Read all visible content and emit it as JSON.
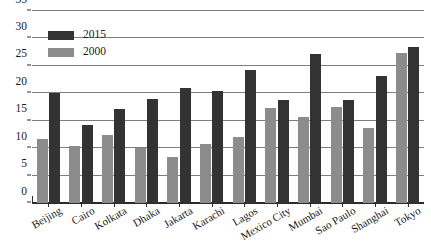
{
  "chart_data": {
    "type": "bar",
    "title": "",
    "subtitle": "",
    "xlabel": "",
    "ylabel": "",
    "ylim": [
      0,
      35
    ],
    "ytick_step": 5,
    "yticks": [
      0,
      5,
      10,
      15,
      20,
      25,
      30,
      35
    ],
    "ytick_labels": [
      "0",
      "5",
      "10",
      "15",
      "20",
      "25",
      "30",
      "35"
    ],
    "grid": true,
    "grid_axis": "y",
    "legend_position": "top-left",
    "categories": [
      "Beijing",
      "Cairo",
      "Kolkata",
      "Dhaka",
      "Jakarta",
      "Karachi",
      "Lagos",
      "Mexico City",
      "Mumbai",
      "Sao Paulo",
      "Shanghai",
      "Tokyo"
    ],
    "series": [
      {
        "name": "2000",
        "color": "#8c8c8c",
        "values": [
          11.6,
          10.4,
          12.4,
          10.0,
          8.4,
          10.8,
          12.0,
          17.4,
          15.6,
          17.5,
          13.6,
          27.4
        ]
      },
      {
        "name": "2015",
        "color": "#333333",
        "values": [
          20.0,
          14.3,
          17.2,
          18.9,
          21.0,
          20.4,
          24.2,
          18.8,
          27.2,
          18.8,
          23.1,
          28.5
        ]
      }
    ]
  },
  "legend": {
    "items": [
      {
        "label": "2015",
        "swatch": "s2015"
      },
      {
        "label": "2000",
        "swatch": "s2000"
      }
    ]
  }
}
